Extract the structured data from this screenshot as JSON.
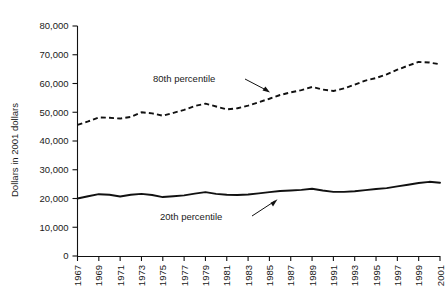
{
  "chart_data": {
    "type": "line",
    "title": "",
    "subtitle": "",
    "xlabel": "",
    "ylabel": "Dollars in 2001 dollars",
    "xlim": [
      1967,
      2001
    ],
    "ylim": [
      0,
      80000
    ],
    "grid": false,
    "legend_position": "inline-annotations",
    "ytick_labels": [
      "0",
      "10,000",
      "20,000",
      "30,000",
      "40,000",
      "50,000",
      "60,000",
      "70,000",
      "80,000"
    ],
    "ytick_values": [
      0,
      10000,
      20000,
      30000,
      40000,
      50000,
      60000,
      70000,
      80000
    ],
    "xtick_labels": [
      "1967",
      "1969",
      "1971",
      "1973",
      "1975",
      "1977",
      "1979",
      "1981",
      "1983",
      "1985",
      "1987",
      "1989",
      "1991",
      "1993",
      "1995",
      "1997",
      "1999",
      "2001"
    ],
    "xtick_values": [
      1967,
      1969,
      1971,
      1973,
      1975,
      1977,
      1979,
      1981,
      1983,
      1985,
      1987,
      1989,
      1991,
      1993,
      1995,
      1997,
      1999,
      2001
    ],
    "x": [
      1967,
      1968,
      1969,
      1970,
      1971,
      1972,
      1973,
      1974,
      1975,
      1976,
      1977,
      1978,
      1979,
      1980,
      1981,
      1982,
      1983,
      1984,
      1985,
      1986,
      1987,
      1988,
      1989,
      1990,
      1991,
      1992,
      1993,
      1994,
      1995,
      1996,
      1997,
      1998,
      1999,
      2000,
      2001
    ],
    "series": [
      {
        "name": "80th percentile",
        "style": "dashed",
        "color": "#111111",
        "values": [
          45600,
          46800,
          48200,
          48100,
          47800,
          48400,
          50000,
          49600,
          48800,
          49800,
          50800,
          52200,
          53000,
          52000,
          51000,
          51400,
          52300,
          53500,
          54700,
          56000,
          56900,
          57700,
          58800,
          57900,
          57400,
          58300,
          59600,
          61000,
          61900,
          63200,
          64800,
          66200,
          67500,
          67300,
          66700
        ]
      },
      {
        "name": "20th percentile",
        "style": "solid",
        "color": "#111111",
        "values": [
          20000,
          20800,
          21500,
          21300,
          20700,
          21300,
          21600,
          21200,
          20500,
          20800,
          21100,
          21700,
          22200,
          21600,
          21300,
          21200,
          21400,
          21800,
          22200,
          22600,
          22800,
          23000,
          23400,
          22800,
          22300,
          22300,
          22500,
          22900,
          23300,
          23600,
          24200,
          24800,
          25400,
          25800,
          25500
        ]
      }
    ],
    "annotations": [
      {
        "label": "80th percentile",
        "points_to_series": "80th percentile",
        "arrow_target_year": 1984
      },
      {
        "label": "20th percentile",
        "points_to_series": "20th percentile",
        "arrow_target_year": 1988
      }
    ]
  }
}
